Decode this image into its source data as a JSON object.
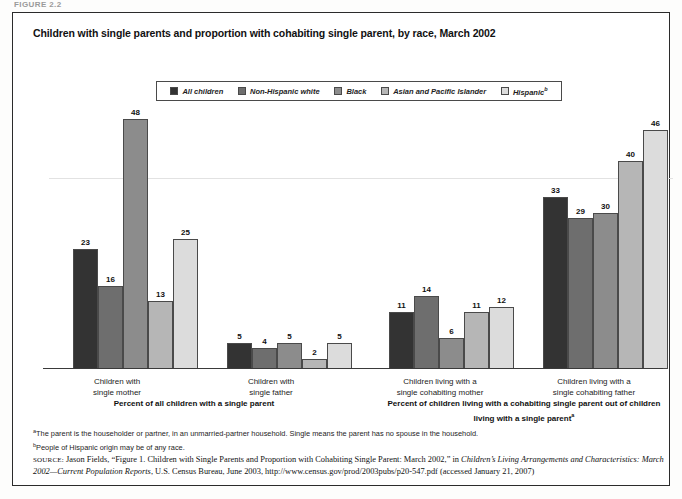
{
  "figure_tag": "FIGURE 2.2",
  "title": "Children with single parents and proportion with cohabiting single parent, by race, March 2002",
  "legend": {
    "items": [
      {
        "label": "All children",
        "color": "#333333",
        "sup": ""
      },
      {
        "label": "Non-Hispanic white",
        "color": "#6e6e6e",
        "sup": ""
      },
      {
        "label": "Black",
        "color": "#8c8c8c",
        "sup": ""
      },
      {
        "label": "Asian and Pacific Islander",
        "color": "#b6b6b6",
        "sup": ""
      },
      {
        "label": "Hispanic",
        "color": "#dcdcdc",
        "sup": "b"
      }
    ]
  },
  "sections": [
    {
      "label": "Percent of all children with a single parent",
      "sup": ""
    },
    {
      "label": "Percent of children living with a cohabiting single parent out of children living with a single parent",
      "sup": "a"
    }
  ],
  "footnotes": [
    {
      "sup": "a",
      "text": "The parent is the householder or partner, in an unmarried-partner household. Single means the parent has no spouse in the household."
    },
    {
      "sup": "b",
      "text": "People of Hispanic origin may be of any race."
    }
  ],
  "source": {
    "prefix": "SOURCE:",
    "part1": " Jason Fields, “Figure 1. Children with Single Parents and Proportion with Cohabiting Single Parent: March 2002,” in ",
    "italic1": "Children’s Living Arrangements and Characteristics: March 2002—Current Population Reports",
    "part2": ", U.S. Census Bureau, June 2003, http://www.census.gov/prod/2003pubs/p20-547.pdf (accessed January 21, 2007)"
  },
  "chart_data": {
    "type": "bar",
    "title": "Children with single parents and proportion with cohabiting single parent, by race, March 2002",
    "xlabel": "",
    "ylabel": "Percent",
    "ylim": [
      0,
      50
    ],
    "grid": true,
    "legend_position": "top",
    "categories": [
      "Children with single mother",
      "Children with single father",
      "Children living with a single cohabiting mother",
      "Children living with a single cohabiting father"
    ],
    "series": [
      {
        "name": "All children",
        "color": "#333333",
        "values": [
          23,
          5,
          11,
          33
        ]
      },
      {
        "name": "Non-Hispanic white",
        "color": "#6e6e6e",
        "values": [
          16,
          4,
          14,
          29
        ]
      },
      {
        "name": "Black",
        "color": "#8c8c8c",
        "values": [
          48,
          5,
          6,
          30
        ]
      },
      {
        "name": "Asian and Pacific Islander",
        "color": "#b6b6b6",
        "values": [
          13,
          2,
          11,
          40
        ]
      },
      {
        "name": "Hispanic",
        "color": "#dcdcdc",
        "values": [
          25,
          5,
          12,
          46
        ]
      }
    ],
    "annotations": [
      "Percent of all children with a single parent",
      "Percent of children living with a cohabiting single parent out of children living with a single parent"
    ]
  }
}
